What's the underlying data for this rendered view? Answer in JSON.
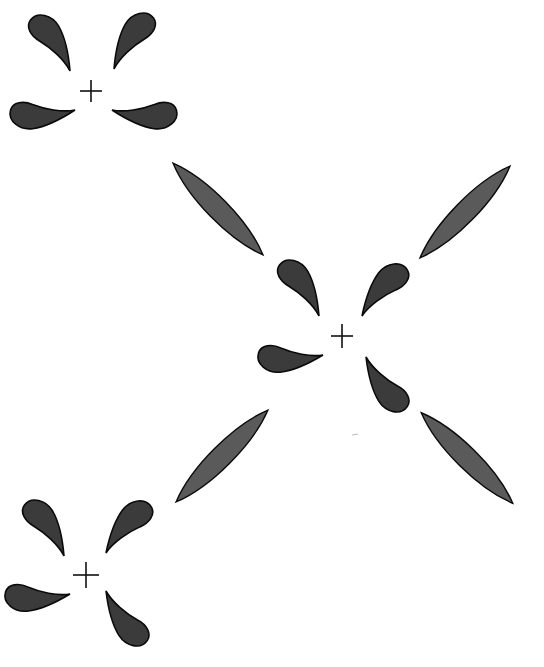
{
  "diagram": {
    "colors": {
      "background": "#ffffff",
      "lobe_fill": "#3b3b3b",
      "lens_fill": "#5a5a5a",
      "outline": "#0a0a0a"
    },
    "centers": [
      {
        "id": "top-left",
        "x": 91,
        "y": 91,
        "marker": "+"
      },
      {
        "id": "middle",
        "x": 342,
        "y": 336,
        "marker": "+"
      },
      {
        "id": "bottom-left",
        "x": 86,
        "y": 575,
        "marker": "+"
      }
    ],
    "lenses": [
      {
        "id": "upper-left",
        "from": [
          173,
          163
        ],
        "to": [
          263,
          255
        ]
      },
      {
        "id": "upper-right",
        "from": [
          420,
          258
        ],
        "to": [
          510,
          166
        ]
      },
      {
        "id": "lower-left",
        "from": [
          176,
          502
        ],
        "to": [
          268,
          410
        ]
      },
      {
        "id": "lower-right",
        "from": [
          422,
          413
        ],
        "to": [
          513,
          503
        ]
      }
    ]
  }
}
